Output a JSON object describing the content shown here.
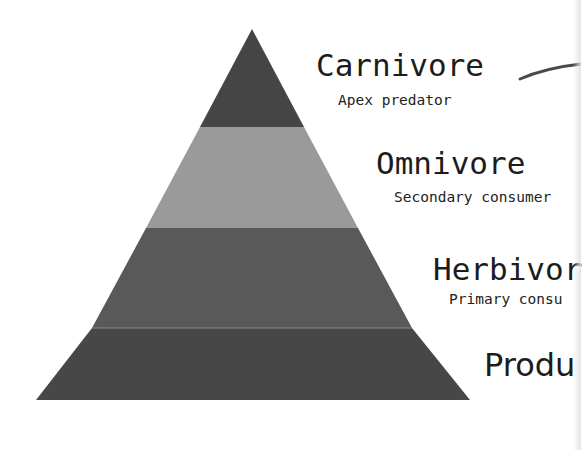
{
  "diagram": {
    "type": "trophic-pyramid",
    "levels": [
      {
        "id": "carnivore",
        "title": "Carnivore",
        "subtitle": "Apex predator",
        "color": "#454545"
      },
      {
        "id": "omnivore",
        "title": "Omnivore",
        "subtitle": "Secondary consumer",
        "color": "#9a9a9a"
      },
      {
        "id": "herbivore",
        "title": "Herbivore",
        "subtitle": "Primary consumer",
        "color": "#595959"
      },
      {
        "id": "producer",
        "title": "Producer",
        "subtitle": "",
        "color": "#474747"
      }
    ],
    "visible_text": {
      "carnivore_title": "Carnivore",
      "carnivore_subtitle": "Apex predator",
      "omnivore_title": "Omnivore",
      "omnivore_subtitle": "Secondary consumer",
      "herbivore_title": "Herbivor",
      "herbivore_subtitle": "Primary consu",
      "producer_title": "Produ"
    },
    "connector_color": "#4a4a4a",
    "divider_color": "#8a8a8a",
    "background": "#ffffff"
  }
}
